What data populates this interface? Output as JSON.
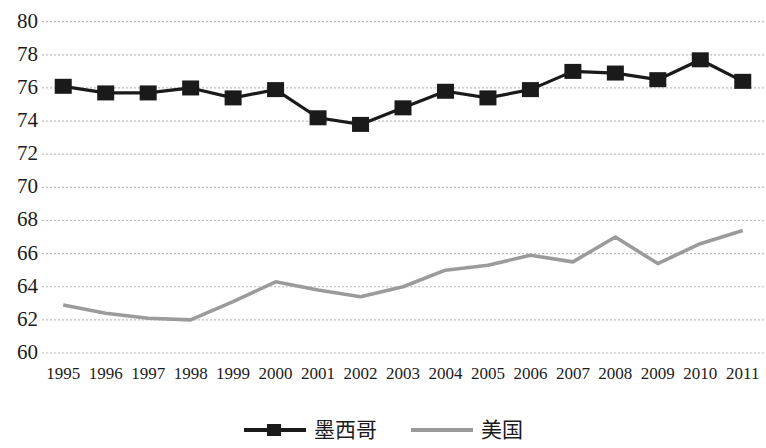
{
  "chart_data": {
    "type": "line",
    "title": "",
    "subtitle": "",
    "xlabel": "",
    "ylabel": "",
    "xlim": [
      1995,
      2011
    ],
    "ylim": [
      60,
      80
    ],
    "ytick_step": 2,
    "grid": true,
    "grid_style": "dotted",
    "legend_position": "bottom-center",
    "categories": [
      "1995",
      "1996",
      "1997",
      "1998",
      "1999",
      "2000",
      "2001",
      "2002",
      "2003",
      "2004",
      "2005",
      "2006",
      "2007",
      "2008",
      "2009",
      "2010",
      "2011"
    ],
    "yticks": [
      "80",
      "78",
      "76",
      "74",
      "72",
      "70",
      "68",
      "66",
      "64",
      "62",
      "60"
    ],
    "series": [
      {
        "name": "墨西哥",
        "color": "#1a1a1a",
        "marker": "square",
        "values": [
          76.1,
          75.7,
          75.7,
          76.0,
          75.4,
          75.9,
          74.2,
          73.8,
          74.8,
          75.8,
          75.4,
          75.9,
          77.0,
          76.9,
          76.5,
          77.7,
          76.4
        ]
      },
      {
        "name": "美国",
        "color": "#9b9b9b",
        "marker": "none",
        "values": [
          62.9,
          62.4,
          62.1,
          62.0,
          63.1,
          64.3,
          63.8,
          63.4,
          64.0,
          65.0,
          65.3,
          65.9,
          65.5,
          67.0,
          65.4,
          66.6,
          67.4
        ]
      }
    ]
  },
  "legend": {
    "entries": [
      {
        "label": "墨西哥"
      },
      {
        "label": "美国"
      }
    ]
  },
  "colors": {
    "mexico": "#1a1a1a",
    "usa": "#9b9b9b",
    "grid": "#bdbdbd",
    "text": "#1b1b1b",
    "background": "#ffffff"
  }
}
